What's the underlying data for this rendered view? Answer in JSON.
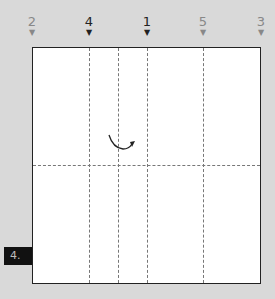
{
  "step_label": "4.",
  "markers": [
    {
      "label": "2",
      "x": 32,
      "emphasis": "light"
    },
    {
      "label": "4",
      "x": 89,
      "emphasis": "dark"
    },
    {
      "label": "1",
      "x": 147,
      "emphasis": "dark"
    },
    {
      "label": "5",
      "x": 203,
      "emphasis": "light"
    },
    {
      "label": "3",
      "x": 261,
      "emphasis": "light"
    }
  ],
  "fold_lines": {
    "vertical_x": [
      89,
      118,
      147,
      203
    ],
    "horizontal_y": [
      165
    ]
  },
  "colors": {
    "background": "#d9d9d9",
    "paper": "#ffffff",
    "dashed": "#777777",
    "step_box": "#111111"
  }
}
